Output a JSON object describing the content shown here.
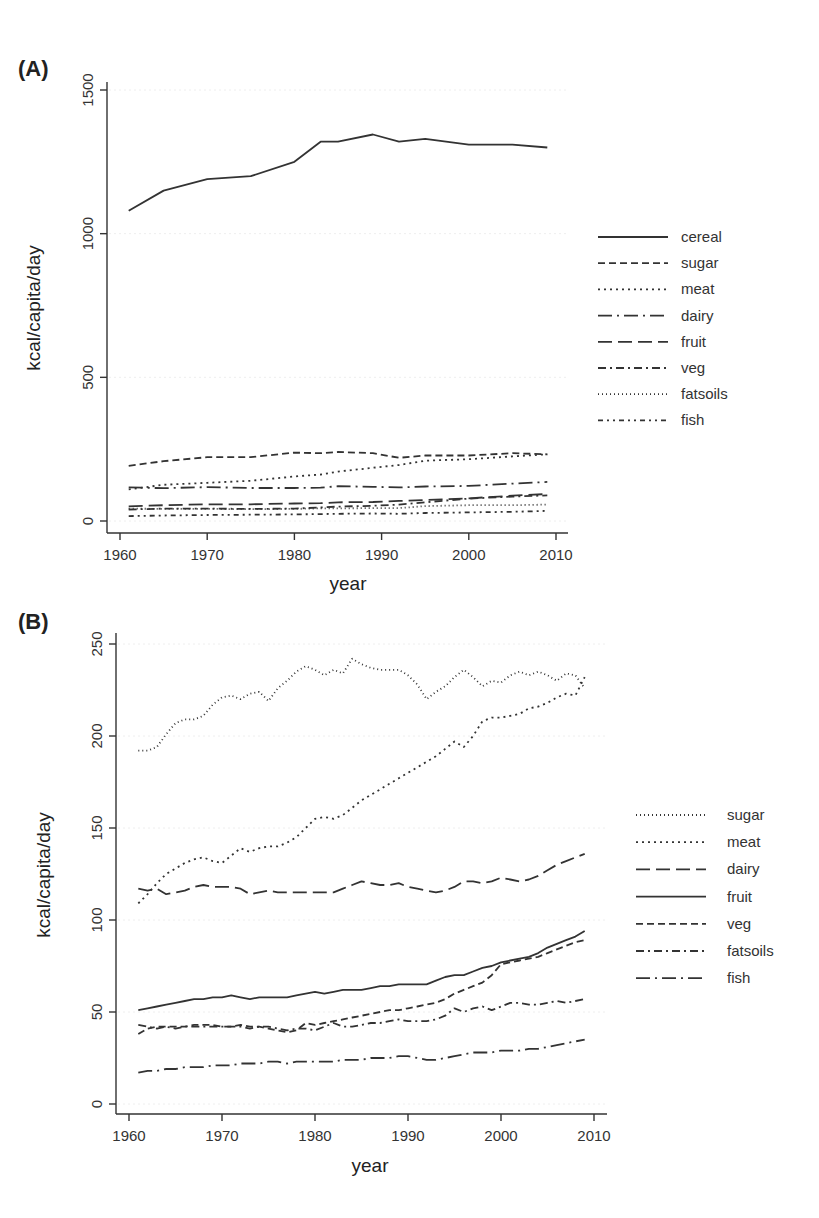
{
  "chart_data": [
    {
      "panel": "(A)",
      "type": "line",
      "xlabel": "year",
      "ylabel": "kcal/capita/day",
      "xlim": [
        1958,
        2011
      ],
      "ylim": [
        -50,
        1530
      ],
      "xticks": [
        1960,
        1970,
        1980,
        1990,
        2000,
        2010
      ],
      "yticks": [
        0,
        500,
        1000,
        1500
      ],
      "grid": true,
      "legend_position": "right",
      "x": [
        1961,
        1965,
        1970,
        1975,
        1980,
        1983,
        1985,
        1989,
        1992,
        1995,
        2000,
        2005,
        2009
      ],
      "series": [
        {
          "name": "cereal",
          "style": "solid",
          "values": [
            1080,
            1150,
            1190,
            1200,
            1250,
            1320,
            1320,
            1345,
            1320,
            1330,
            1310,
            1310,
            1300
          ]
        },
        {
          "name": "sugar",
          "style": "dashed",
          "values": [
            192,
            208,
            222,
            222,
            238,
            236,
            240,
            236,
            220,
            228,
            228,
            236,
            232
          ]
        },
        {
          "name": "meat",
          "style": "dotted",
          "values": [
            110,
            126,
            133,
            140,
            155,
            162,
            172,
            185,
            195,
            210,
            215,
            225,
            232
          ]
        },
        {
          "name": "dairy",
          "style": "longdash-dot",
          "values": [
            117,
            114,
            118,
            115,
            115,
            116,
            121,
            119,
            117,
            120,
            122,
            130,
            136
          ]
        },
        {
          "name": "fruit",
          "style": "longdash",
          "values": [
            51,
            55,
            58,
            58,
            61,
            62,
            65,
            66,
            70,
            73,
            79,
            88,
            94
          ]
        },
        {
          "name": "veg",
          "style": "dash-dot",
          "values": [
            40,
            43,
            43,
            42,
            43,
            47,
            50,
            53,
            57,
            65,
            78,
            85,
            89
          ]
        },
        {
          "name": "fatsoils",
          "style": "fine-dotted",
          "values": [
            43,
            42,
            42,
            41,
            42,
            44,
            44,
            45,
            45,
            52,
            55,
            55,
            57
          ]
        },
        {
          "name": "fish",
          "style": "dot-dash-dot",
          "values": [
            17,
            19,
            21,
            22,
            23,
            24,
            25,
            26,
            25,
            28,
            30,
            32,
            35
          ]
        }
      ]
    },
    {
      "panel": "(B)",
      "type": "line",
      "xlabel": "year",
      "ylabel": "kcal/capita/day",
      "xlim": [
        1958,
        2011
      ],
      "ylim": [
        -5,
        255
      ],
      "xticks": [
        1960,
        1970,
        1980,
        1990,
        2000,
        2010
      ],
      "yticks": [
        0,
        50,
        100,
        150,
        200,
        250
      ],
      "grid": true,
      "legend_position": "right",
      "x": [
        1961,
        1962,
        1963,
        1964,
        1965,
        1966,
        1967,
        1968,
        1969,
        1970,
        1971,
        1972,
        1973,
        1974,
        1975,
        1976,
        1977,
        1978,
        1979,
        1980,
        1981,
        1982,
        1983,
        1984,
        1985,
        1986,
        1987,
        1988,
        1989,
        1990,
        1991,
        1992,
        1993,
        1994,
        1995,
        1996,
        1997,
        1998,
        1999,
        2000,
        2001,
        2002,
        2003,
        2004,
        2005,
        2006,
        2007,
        2008,
        2009
      ],
      "series": [
        {
          "name": "sugar",
          "style": "fine-dotted",
          "values": [
            192,
            192,
            194,
            201,
            207,
            209,
            209,
            211,
            217,
            221,
            222,
            220,
            223,
            224,
            219,
            226,
            230,
            235,
            238,
            236,
            233,
            236,
            234,
            242,
            239,
            237,
            236,
            236,
            236,
            233,
            228,
            220,
            224,
            227,
            232,
            236,
            232,
            227,
            230,
            229,
            233,
            235,
            233,
            235,
            233,
            230,
            234,
            233,
            226
          ]
        },
        {
          "name": "meat",
          "style": "dotted",
          "values": [
            109,
            114,
            120,
            125,
            128,
            131,
            133,
            134,
            132,
            131,
            135,
            139,
            137,
            139,
            140,
            140,
            142,
            145,
            150,
            155,
            156,
            155,
            157,
            161,
            165,
            168,
            171,
            174,
            177,
            180,
            183,
            186,
            189,
            193,
            197,
            194,
            200,
            208,
            210,
            210,
            211,
            212,
            215,
            216,
            218,
            221,
            223,
            222,
            232
          ]
        },
        {
          "name": "dairy",
          "style": "longdash",
          "values": [
            117,
            116,
            117,
            114,
            115,
            116,
            118,
            119,
            118,
            118,
            118,
            117,
            114,
            115,
            116,
            115,
            115,
            115,
            115,
            115,
            115,
            115,
            117,
            119,
            121,
            120,
            119,
            119,
            120,
            118,
            117,
            116,
            115,
            116,
            118,
            121,
            121,
            120,
            121,
            123,
            122,
            121,
            122,
            124,
            127,
            130,
            132,
            134,
            136
          ]
        },
        {
          "name": "fruit",
          "style": "solid",
          "values": [
            51,
            52,
            53,
            54,
            55,
            56,
            57,
            57,
            58,
            58,
            59,
            58,
            57,
            58,
            58,
            58,
            58,
            59,
            60,
            61,
            60,
            61,
            62,
            62,
            62,
            63,
            64,
            64,
            65,
            65,
            65,
            65,
            67,
            69,
            70,
            70,
            72,
            74,
            75,
            77,
            78,
            79,
            80,
            82,
            85,
            87,
            89,
            91,
            94
          ]
        },
        {
          "name": "veg",
          "style": "dashed",
          "values": [
            38,
            41,
            42,
            42,
            42,
            42,
            43,
            43,
            43,
            42,
            42,
            43,
            42,
            42,
            41,
            40,
            39,
            40,
            44,
            43,
            44,
            45,
            46,
            47,
            48,
            49,
            50,
            51,
            51,
            52,
            53,
            54,
            55,
            57,
            60,
            62,
            64,
            66,
            70,
            76,
            77,
            78,
            79,
            80,
            82,
            84,
            86,
            88,
            89
          ]
        },
        {
          "name": "fatsoils",
          "style": "dash-dot",
          "values": [
            43,
            42,
            41,
            42,
            41,
            42,
            42,
            42,
            42,
            42,
            42,
            42,
            41,
            42,
            42,
            41,
            40,
            41,
            41,
            40,
            42,
            44,
            42,
            42,
            43,
            44,
            44,
            45,
            46,
            45,
            45,
            45,
            46,
            48,
            52,
            50,
            52,
            53,
            51,
            53,
            55,
            55,
            54,
            54,
            55,
            56,
            55,
            56,
            57
          ]
        },
        {
          "name": "fish",
          "style": "longdash-dot",
          "values": [
            17,
            18,
            18,
            19,
            19,
            20,
            20,
            20,
            21,
            21,
            21,
            22,
            22,
            22,
            23,
            23,
            22,
            23,
            23,
            23,
            23,
            23,
            24,
            24,
            24,
            25,
            25,
            25,
            26,
            26,
            25,
            24,
            24,
            25,
            26,
            27,
            28,
            28,
            28,
            29,
            29,
            29,
            30,
            30,
            31,
            32,
            33,
            34,
            35
          ]
        }
      ]
    }
  ],
  "panels": {
    "a": {
      "label": "(A)",
      "xlabel": "year",
      "ylabel": "kcal/capita/day",
      "xticks": [
        "1960",
        "1970",
        "1980",
        "1990",
        "2000",
        "2010"
      ],
      "yticks": [
        "0",
        "500",
        "1000",
        "1500"
      ],
      "legend": [
        "cereal",
        "sugar",
        "meat",
        "dairy",
        "fruit",
        "veg",
        "fatsoils",
        "fish"
      ]
    },
    "b": {
      "label": "(B)",
      "xlabel": "year",
      "ylabel": "kcal/capita/day",
      "xticks": [
        "1960",
        "1970",
        "1980",
        "1990",
        "2000",
        "2010"
      ],
      "yticks": [
        "0",
        "50",
        "100",
        "150",
        "200",
        "250"
      ],
      "legend": [
        "sugar",
        "meat",
        "dairy",
        "fruit",
        "veg",
        "fatsoils",
        "fish"
      ]
    }
  },
  "styles": {
    "solid": "",
    "dashed": "7 4",
    "dotted": "2 4",
    "fine-dotted": "1 3",
    "longdash": "14 6",
    "longdash-dot": "14 5 2 5",
    "dash-dot": "8 4 2 4",
    "dot-dash-dot": "5 4 2 4 2 4"
  },
  "colors": {
    "line": "#333333",
    "axis": "#333333",
    "grid": "#eeeeee"
  }
}
